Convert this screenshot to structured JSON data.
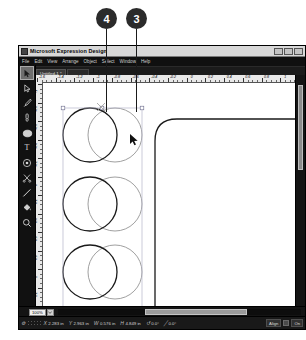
{
  "callouts": [
    {
      "label": "4",
      "x": 96,
      "y": 8,
      "line_x": 106,
      "line_top": 29,
      "line_bottom": 112
    },
    {
      "label": "3",
      "x": 126,
      "y": 8,
      "line_x": 136,
      "line_top": 29,
      "line_bottom": 112
    }
  ],
  "window": {
    "title": "Microsoft Expression Design",
    "icon": "app-icon",
    "buttons": [
      "minimize",
      "maximize",
      "close"
    ]
  },
  "menu": {
    "items": [
      "File",
      "Edit",
      "View",
      "Arrange",
      "Object",
      "Select",
      "Window",
      "Help"
    ]
  },
  "document_tabs": {
    "active": "Untitled-1 *"
  },
  "toolbox": {
    "tools": [
      {
        "name": "selection-tool",
        "glyph": "arrow",
        "selected": true
      },
      {
        "name": "direct-selection-tool",
        "glyph": "arrow-hollow",
        "selected": false
      },
      {
        "name": "pen-tool",
        "glyph": "pen",
        "selected": false
      },
      {
        "name": "brush-tool",
        "glyph": "brush",
        "selected": false
      },
      {
        "name": "ellipse-tool",
        "glyph": "ellipse",
        "selected": false
      },
      {
        "name": "text-tool",
        "glyph": "T",
        "selected": false
      },
      {
        "name": "gradient-tool",
        "glyph": "gradient",
        "selected": false
      },
      {
        "name": "scissors-tool",
        "glyph": "scissors",
        "selected": false
      },
      {
        "name": "line-tool",
        "glyph": "line",
        "selected": false
      },
      {
        "name": "paint-bucket-tool",
        "glyph": "bucket",
        "selected": false
      },
      {
        "name": "zoom-tool",
        "glyph": "magnifier",
        "selected": false
      }
    ]
  },
  "rulers": {
    "horizontal": {
      "labels": [
        "-1.6",
        "-1.4",
        "-1.2",
        "-1",
        "-0.8",
        "-0.6",
        "-0.4",
        "-0.2",
        "0",
        "0.2",
        "0.4",
        "0.6",
        "0.8",
        "1",
        "1.2"
      ],
      "unit": "in"
    },
    "vertical": {
      "labels": [
        "-1",
        "-0.8",
        "-0.6",
        "-0.4",
        "-0.2",
        "0",
        "0.2",
        "0.4",
        "0.6",
        "0.8",
        "1",
        "1.2",
        "1.4"
      ],
      "unit": "in"
    }
  },
  "canvas": {
    "shapes": [
      {
        "name": "circle-dark-1",
        "type": "circle",
        "cx": 48,
        "cy": 53,
        "r": 27,
        "stroke": "#1a1a1a",
        "stroke_width": 1.3
      },
      {
        "name": "circle-light-1",
        "type": "circle",
        "cx": 73,
        "cy": 53,
        "r": 27,
        "stroke": "#9a9a9a",
        "stroke_width": 1.0
      },
      {
        "name": "circle-dark-2",
        "type": "circle",
        "cx": 48,
        "cy": 122,
        "r": 27,
        "stroke": "#1a1a1a",
        "stroke_width": 1.3
      },
      {
        "name": "circle-light-2",
        "type": "circle",
        "cx": 73,
        "cy": 122,
        "r": 27,
        "stroke": "#9a9a9a",
        "stroke_width": 1.0
      },
      {
        "name": "circle-dark-3",
        "type": "circle",
        "cx": 48,
        "cy": 190,
        "r": 27,
        "stroke": "#1a1a1a",
        "stroke_width": 1.3
      },
      {
        "name": "circle-light-3",
        "type": "circle",
        "cx": 73,
        "cy": 190,
        "r": 27,
        "stroke": "#9a9a9a",
        "stroke_width": 1.0
      },
      {
        "name": "rounded-rectangle",
        "type": "roundrect",
        "x": 113,
        "y": 37,
        "w": 170,
        "h": 200,
        "rx": 22,
        "stroke": "#1a1a1a",
        "stroke_width": 1.3
      }
    ],
    "selection": {
      "name": "selection-bounds",
      "x": 21,
      "y": 26,
      "w": 79,
      "h": 212
    },
    "cursor": {
      "name": "mouse-pointer",
      "x": 88,
      "y": 57
    }
  },
  "zoom_control": {
    "value": "100%",
    "dropdown_icon": "chevron-down-icon"
  },
  "status_bar": {
    "fields": [
      {
        "name": "x-position",
        "icon": "X",
        "value": "2.283 in"
      },
      {
        "name": "y-position",
        "icon": "Y",
        "value": "2.963 in"
      },
      {
        "name": "width",
        "icon": "W",
        "value": "0.576 in"
      },
      {
        "name": "height",
        "icon": "H",
        "value": "4.849 in"
      },
      {
        "name": "rotation",
        "icon": "↺",
        "value": "0.0°"
      },
      {
        "name": "skew",
        "icon": "╱",
        "value": "0.0°"
      }
    ],
    "align_button": "Align",
    "snap_label": "On"
  }
}
